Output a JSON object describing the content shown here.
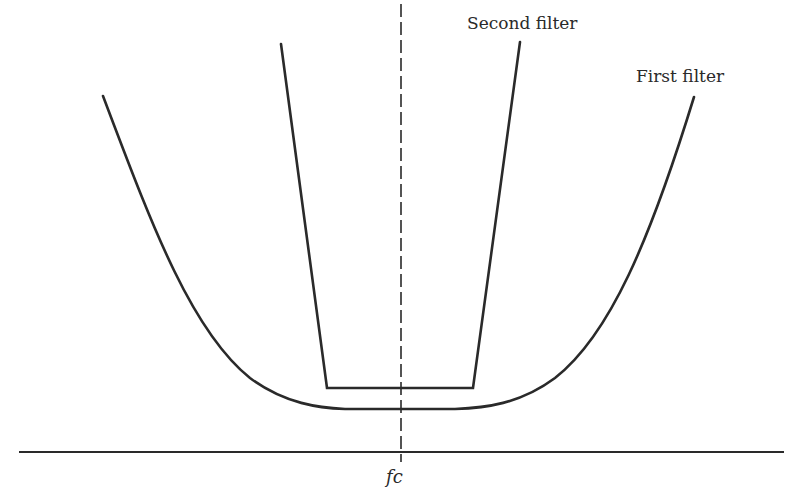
{
  "diagram": {
    "title": "",
    "labels": {
      "second_filter": "Second filter",
      "first_filter": "First filter",
      "center_frequency": "fc"
    },
    "colors": {
      "line": "#2a2a2a",
      "background": "#ffffff"
    },
    "elements": {
      "axis": {
        "x1": 19,
        "y1": 452,
        "x2": 784,
        "y2": 452
      },
      "center_line": {
        "x": 401,
        "y1": 4,
        "y2": 462,
        "style": "dashed"
      },
      "first_filter_curve": {
        "shape": "U-shaped passband response, wide, rounded skirts",
        "left_top": [
          103,
          96
        ],
        "bottom_y": 409,
        "bottom_span": [
          330,
          472
        ],
        "right_top": [
          694,
          97
        ]
      },
      "second_filter_curve": {
        "shape": "steep-sided, flat-bottomed narrow passband",
        "left_top": [
          281,
          44
        ],
        "left_bottom": [
          327,
          388
        ],
        "right_bottom": [
          473,
          388
        ],
        "right_top": [
          520,
          42
        ]
      }
    }
  }
}
